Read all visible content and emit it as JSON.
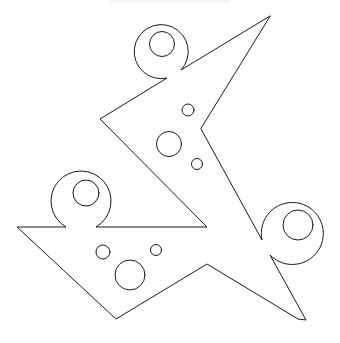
{
  "figure": {
    "stroke_color": "#1a1a1a",
    "background_color": "#ffffff",
    "loops": [
      {
        "name": "top-loop"
      },
      {
        "name": "left-loop"
      },
      {
        "name": "right-loop"
      }
    ],
    "holes": {
      "upper_region_count": 3,
      "lower_region_count": 3
    }
  }
}
